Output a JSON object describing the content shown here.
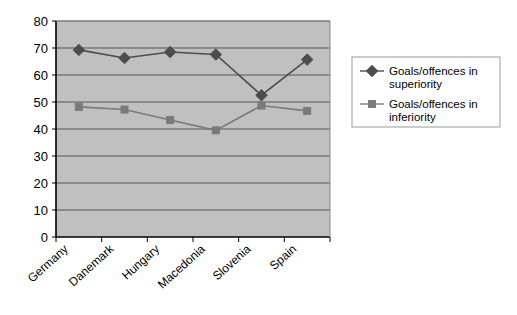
{
  "chart_data": {
    "type": "line",
    "title": "",
    "subtitle": "",
    "xlabel": "",
    "ylabel": "",
    "categories": [
      "Germany",
      "Danemark",
      "Hungary",
      "Macedonia",
      "Slovenia",
      "Spain"
    ],
    "series": [
      {
        "name": "Goals/offences in superiority",
        "values": [
          69.3,
          66.3,
          68.5,
          67.6,
          52.5,
          65.7
        ],
        "marker": "diamond",
        "color": "#4d4d4d"
      },
      {
        "name": "Goals/offences in inferiority",
        "values": [
          48.2,
          47.2,
          43.3,
          39.5,
          48.7,
          46.7
        ],
        "marker": "square",
        "color": "#7a7a7a"
      }
    ],
    "ylim": [
      0,
      80
    ],
    "ytick_step": 10,
    "ytick_labels": [
      "0",
      "10",
      "20",
      "30",
      "40",
      "50",
      "60",
      "70",
      "80"
    ],
    "grid": true,
    "grid_axis": "y",
    "legend_position": "right",
    "plot_background": "#c0c0c0",
    "grid_color": "#555555",
    "axis_color": "#000000",
    "page_background": "#ffffff"
  },
  "legend": {
    "entries": [
      {
        "label_line1": "Goals/offences in",
        "label_line2": "superiority",
        "marker": "diamond-marker-icon"
      },
      {
        "label_line1": "Goals/offences in",
        "label_line2": "inferiority",
        "marker": "square-marker-icon"
      }
    ]
  }
}
